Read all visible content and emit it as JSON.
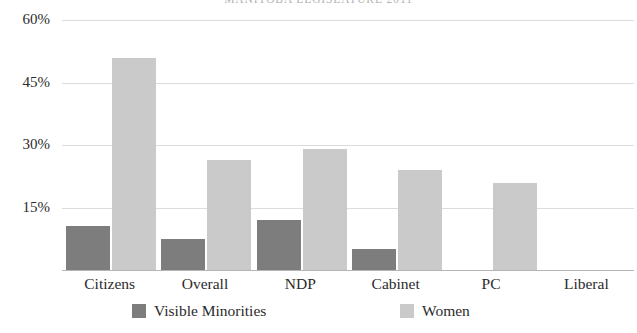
{
  "chart_data": {
    "type": "bar",
    "title": "MANITOBA LEGISLATURE 2011",
    "xlabel": "",
    "ylabel": "",
    "categories": [
      "Citizens",
      "Overall",
      "NDP",
      "Cabinet",
      "PC",
      "Liberal"
    ],
    "series": [
      {
        "name": "Visible Minorities",
        "color": "#7d7d7d",
        "values": [
          10.5,
          7.5,
          12.0,
          5.0,
          0,
          0
        ]
      },
      {
        "name": "Women",
        "color": "#cacaca",
        "values": [
          51.0,
          26.5,
          29.0,
          24.0,
          21.0,
          0
        ]
      }
    ],
    "ylim": [
      0,
      60
    ],
    "yticks": [
      15,
      30,
      45,
      60
    ],
    "ytick_labels": [
      "15%",
      "30%",
      "45%",
      "60%"
    ],
    "grid": true,
    "legend_position": "bottom"
  },
  "legend": {
    "items": [
      {
        "label": "Visible Minorities",
        "color": "#7d7d7d"
      },
      {
        "label": "Women",
        "color": "#cacaca"
      }
    ]
  },
  "colors": {
    "visible_minorities": "#7d7d7d",
    "women": "#cacaca",
    "gridline": "#dcdcdc",
    "axis": "#b4b4b4",
    "text": "#2b2b2b"
  }
}
